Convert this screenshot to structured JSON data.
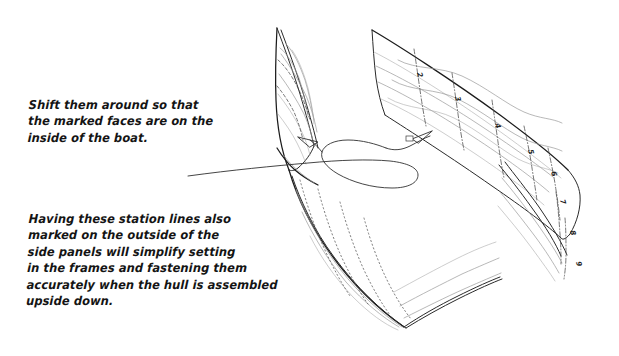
{
  "figure": {
    "kind": "hand-drawn-boat-hull-side-panels-diagram",
    "background_color": "#ffffff",
    "ink_color": "#141414",
    "light_ink_color": "#8d8d8d",
    "notes": [
      {
        "id": "shift-note",
        "name": "annotation-shift-panels",
        "text": "Shift them around so that\nthe marked faces are on the\ninside of the boat."
      },
      {
        "id": "station-note",
        "name": "annotation-station-lines",
        "text": "Having these station lines also\nmarked on the outside of the\nside panels will simplify setting\nin the frames and fastening them\naccurately when the hull is assembled\nupside down."
      }
    ],
    "station_labels": [
      "2",
      "3",
      "4",
      "5",
      "6",
      "7",
      "8",
      "9"
    ],
    "leader": {
      "name": "curved-leader-line",
      "arrowheads": 2,
      "description": "looping leader line from the notes to both side panels"
    },
    "parts": [
      {
        "name": "left-side-panel",
        "label": "left side panel"
      },
      {
        "name": "right-side-panel",
        "label": "right side panel"
      },
      {
        "name": "lower-side-panel",
        "label": "lower side panel"
      },
      {
        "name": "bow-joint",
        "label": "bow joint"
      }
    ]
  }
}
